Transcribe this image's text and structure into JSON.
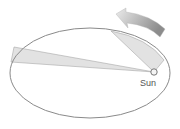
{
  "diagram": {
    "labels": {
      "sun": "Sun"
    },
    "elements": {
      "orbit": "elliptical-orbit",
      "sun": "sun-at-focus",
      "sector_near": "swept-area-near-sun",
      "sector_far": "swept-area-far-from-sun",
      "motion_arrow": "direction-of-motion-arrow"
    },
    "colors": {
      "orbit_stroke": "#8a8a8a",
      "sector_fill": "#e2e2e2",
      "sector_stroke": "#a8a8a8",
      "arrow_light": "#e6e6e6",
      "arrow_dark": "#8c8c8c",
      "sun_stroke": "#6a6a6a",
      "label": "#555555"
    }
  }
}
